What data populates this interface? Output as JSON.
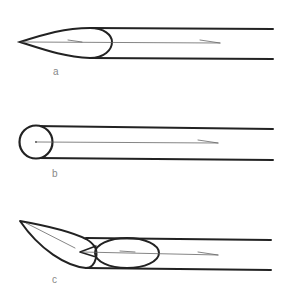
{
  "figure": {
    "panels": [
      {
        "id": "a",
        "label": "a",
        "description": "needle tip with conical bevel"
      },
      {
        "id": "b",
        "label": "b",
        "description": "needle with rounded (ball) tip"
      },
      {
        "id": "c",
        "label": "c",
        "description": "needle with angled lancet bevel"
      }
    ],
    "colors": {
      "stroke": "#222222",
      "thin_line": "#555555",
      "label": "#888888",
      "background": "#ffffff"
    }
  }
}
